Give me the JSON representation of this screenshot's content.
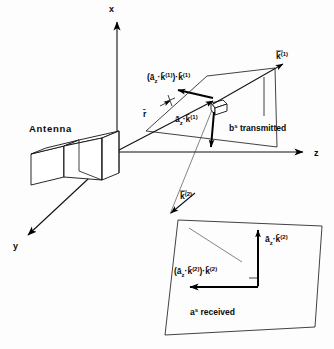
{
  "figure": {
    "background_color": "#fdfdfd",
    "line_color": "#111111"
  },
  "axes": {
    "x_label": "x",
    "y_label": "y",
    "z_label": "z",
    "origin_label": "O"
  },
  "labels": {
    "antenna": "Antenna",
    "r_vector": "r̄",
    "k1_vector": "k̄",
    "k1_sup": "(1)",
    "k2_vector": "k̄",
    "k2_sup": "(2)",
    "az_dot_k1": "ā",
    "az_dot_k1_sub": "z",
    "az_dot_k1_mid": "·k̄",
    "az_dot_k1_sup": "(1)",
    "proj1_open": "(ā",
    "proj1_sub": "z",
    "proj1_mid": "·k̄",
    "proj1_sup1": "(1)",
    "proj1_close": ")·k̄",
    "proj1_sup2": "(1)",
    "b_transmitted_base": "b",
    "b_transmitted_sup": "s",
    "b_transmitted_rest": " transmitted",
    "az_dot_k2": "ā",
    "az_dot_k2_sub": "z",
    "az_dot_k2_mid": "·k̄",
    "az_dot_k2_sup": "(2)",
    "proj2_open": "(ā",
    "proj2_sub": "z",
    "proj2_mid": "·k̄",
    "proj2_sup1": "(2)",
    "proj2_close": ")·k̄",
    "proj2_sup2": "(2)",
    "a_received_base": "a",
    "a_received_sup": "s",
    "a_received_rest": " received"
  },
  "geometry": {
    "origin": {
      "x": 117,
      "y": 152
    },
    "x_axis_tip": {
      "x": 117,
      "y": 18
    },
    "z_axis_tip": {
      "x": 310,
      "y": 152
    },
    "y_axis_tip": {
      "x": 22,
      "y": 241
    },
    "k1_tip": {
      "x": 285,
      "y": 62
    },
    "k2_tip": {
      "x": 175,
      "y": 210
    },
    "scatterer_cube": {
      "x": 218,
      "y": 103
    },
    "plane_transmitted_label": "upper parallelogram plane",
    "plane_received_label": "lower parallelogram plane"
  }
}
